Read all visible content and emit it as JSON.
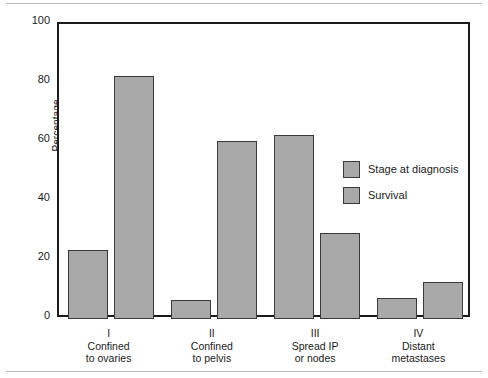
{
  "chart_data": {
    "type": "bar",
    "title": "",
    "subtitle": "",
    "xlabel": "",
    "ylabel": "Percentage",
    "ylim": [
      0,
      100
    ],
    "yticks": [
      0,
      20,
      40,
      60,
      80,
      100
    ],
    "grid": false,
    "legend_position": "inside-right",
    "categories": [
      "I",
      "II",
      "III",
      "IV"
    ],
    "category_captions": [
      {
        "roman": "I",
        "line1": "Confined",
        "line2": "to ovaries"
      },
      {
        "roman": "II",
        "line1": "Confined",
        "line2": "to pelvis"
      },
      {
        "roman": "III",
        "line1": "Spread IP",
        "line2": "or nodes"
      },
      {
        "roman": "IV",
        "line1": "Distant",
        "line2": "metastases"
      }
    ],
    "series": [
      {
        "name": "Stage at diagnosis",
        "values": [
          23.5,
          6.5,
          62.5,
          7.0
        ]
      },
      {
        "name": "Survival",
        "values": [
          82.5,
          60.5,
          29.0,
          12.5
        ]
      }
    ],
    "colors": {
      "bar_fill": "#a9a9a9",
      "bar_stroke": "#3a3a3a",
      "axis": "#1b1b1b",
      "background": "#ffffff"
    }
  },
  "legend": {
    "items": [
      {
        "label": "Stage at diagnosis"
      },
      {
        "label": "Survival"
      }
    ]
  },
  "axes": {
    "y_title": "Percentage",
    "y_tick_labels": [
      "100",
      "80",
      "60",
      "40",
      "20",
      "0"
    ]
  }
}
